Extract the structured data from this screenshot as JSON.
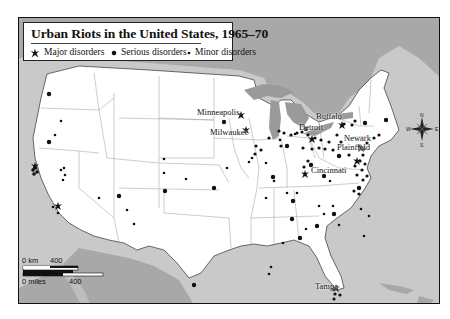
{
  "map": {
    "title": "Urban Riots in the United States, 1965–70",
    "legend": [
      {
        "symbol": "major-disorder-star",
        "label": "Major disorders"
      },
      {
        "symbol": "serious-disorder-dot",
        "label": "Serious disorders"
      },
      {
        "symbol": "minor-disorder-dot",
        "label": "Minor disorders"
      }
    ],
    "cities": [
      {
        "name": "Minneapolis"
      },
      {
        "name": "Milwaukee"
      },
      {
        "name": "Detroit"
      },
      {
        "name": "Buffalo"
      },
      {
        "name": "Newark"
      },
      {
        "name": "Plainfield"
      },
      {
        "name": "Cincinnati"
      },
      {
        "name": "Tampa"
      }
    ],
    "compass": {
      "n": "N",
      "s": "S",
      "e": "E",
      "w": "W"
    },
    "scale": {
      "km_zero": "0 km",
      "km_max": "400",
      "miles_zero": "0 miles",
      "miles_max": "400"
    },
    "colors": {
      "land_us": "#ffffff",
      "land_other": "#a8a8a8",
      "water": "#c9c9c9",
      "lakes": "#9a9a9a",
      "symbols": "#111111"
    }
  }
}
